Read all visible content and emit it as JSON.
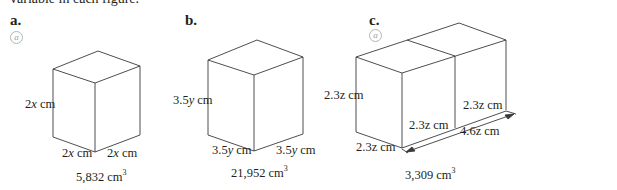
{
  "header": {
    "cut_text": "variable in each figure."
  },
  "figures": [
    {
      "label": "a.",
      "icon": "at-sign-icon",
      "shape": "cube",
      "dimensions": {
        "height": "2x cm",
        "depth": "2x cm",
        "width": "2x cm"
      },
      "dim_parts": {
        "height_num": "2",
        "height_var": "x",
        "depth_num": "2",
        "depth_var": "x",
        "width_num": "2",
        "width_var": "x",
        "unit": " cm"
      },
      "volume": "5,832 cm",
      "volume_exp": "3"
    },
    {
      "label": "b.",
      "icon": null,
      "shape": "cube",
      "dimensions": {
        "height": "3.5y cm",
        "depth": "3.5y cm",
        "width": "3.5y cm"
      },
      "dim_parts": {
        "height_num": "3.5",
        "height_var": "y",
        "depth_num": "3.5",
        "depth_var": "y",
        "width_num": "3.5",
        "width_var": "y",
        "unit": " cm"
      },
      "volume": "21,952 cm",
      "volume_exp": "3"
    },
    {
      "label": "c.",
      "icon": "at-sign-icon",
      "shape": "rectangular-prism (two cubes)",
      "dimensions": {
        "height": "2.3z cm",
        "depth": "2.3z cm",
        "inner_1": "2.3z cm",
        "inner_2": "2.3z cm",
        "length": "4.6z cm"
      },
      "volume": "3,309 cm",
      "volume_exp": "3"
    }
  ],
  "colors": {
    "line": "#3a3a3a",
    "text": "#231f20",
    "icon": "#a0a0a0"
  }
}
